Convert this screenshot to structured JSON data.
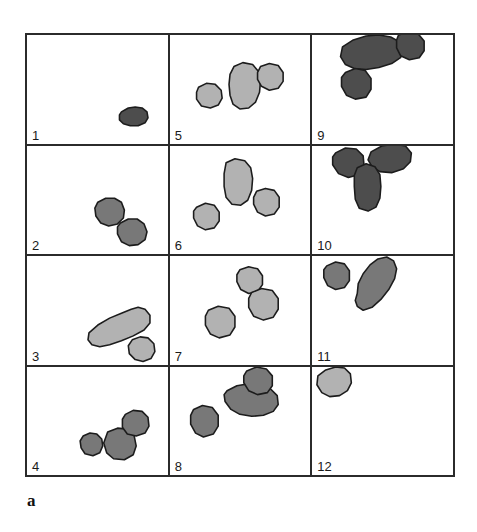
{
  "figure": {
    "caption": "a",
    "grid": {
      "rows": 4,
      "columns": 3,
      "total_panels": 12
    },
    "colors": {
      "light_gray": "#b2b2b2",
      "medium_gray": "#787878",
      "dark_gray": "#4d4d4d",
      "outline": "#1c1c1c",
      "grid_line": "#2b2b2b",
      "background": "#ffffff",
      "label_text": "#1a1a1a"
    },
    "shade_legend": {
      "light_gray": "lightest shaded particles",
      "medium_gray": "mid shaded particles",
      "dark_gray": "darkest shaded particles"
    }
  },
  "panels": [
    {
      "label": "1",
      "position": "row1-col1",
      "blob_count": 1,
      "shade": "dark_gray",
      "description": "single small elongated dark blob at lower right",
      "blobs": [
        {
          "name": "blob-1-1",
          "shade": "dark_gray",
          "points": "96,78 103,74 110,73 117,74 122,78 123,84 120,89 113,92 105,92 98,90 94,86 94,81"
        }
      ]
    },
    {
      "label": "2",
      "position": "row2-col1",
      "blob_count": 2,
      "shade": "medium_gray",
      "description": "two medium gray round blobs lower right, touching diagonally",
      "blobs": [
        {
          "name": "blob-2-1",
          "shade": "medium_gray",
          "points": "72,57 80,53 89,53 96,57 99,65 98,73 92,79 83,81 75,78 70,71 69,63"
        },
        {
          "name": "blob-2-2",
          "shade": "medium_gray",
          "points": "95,78 103,74 112,74 119,79 122,87 120,95 113,100 104,101 96,97 92,89 92,82"
        }
      ]
    },
    {
      "label": "3",
      "position": "row3-col1",
      "blob_count": 2,
      "shade": "light_gray",
      "description": "long diagonal light blob with small round blob at lower right end",
      "blobs": [
        {
          "name": "blob-3-1",
          "shade": "light_gray",
          "points": "63,78 72,70 84,63 96,58 106,54 113,52 120,54 125,60 125,68 119,75 108,81 96,86 84,90 74,92 66,90 62,85"
        },
        {
          "name": "blob-3-2",
          "shade": "light_gray",
          "points": "107,85 115,82 123,83 129,89 130,97 126,104 118,107 110,105 104,99 103,91"
        }
      ]
    },
    {
      "label": "4",
      "position": "row4-col1",
      "blob_count": 3,
      "shade": "medium_gray",
      "description": "three gray blobs, two touching at right, one separate at left",
      "blobs": [
        {
          "name": "blob-4-1",
          "shade": "medium_gray",
          "points": "57,70 64,67 71,68 76,73 77,80 74,87 67,90 59,88 55,82 54,75"
        },
        {
          "name": "blob-4-2",
          "shade": "medium_gray",
          "points": "82,66 92,62 102,63 109,70 111,80 108,89 99,94 88,93 81,87 78,77"
        },
        {
          "name": "blob-4-3",
          "shade": "medium_gray",
          "points": "100,48 108,44 117,45 123,51 124,60 120,67 111,70 102,68 97,61 97,53"
        }
      ]
    },
    {
      "label": "5",
      "position": "row1-col2",
      "blob_count": 3,
      "shade": "light_gray",
      "description": "vertical elongated light blob center with round blob right and round blob left",
      "blobs": [
        {
          "name": "blob-5-1",
          "shade": "light_gray",
          "points": "29,53 37,49 46,50 52,56 53,64 49,71 41,74 32,72 27,65 27,58"
        },
        {
          "name": "blob-5-2",
          "shade": "light_gray",
          "points": "65,32 74,28 84,30 90,37 92,47 91,58 87,68 80,74 71,75 64,70 61,61 60,50 61,40"
        },
        {
          "name": "blob-5-3",
          "shade": "light_gray",
          "points": "92,32 101,29 110,31 115,38 115,47 110,54 101,56 93,52 89,45 89,38"
        }
      ]
    },
    {
      "label": "6",
      "position": "row2-col2",
      "blob_count": 3,
      "shade": "light_gray",
      "description": "tall vertical light blob upper center, round blob to its lower right, round blob lower left",
      "blobs": [
        {
          "name": "blob-6-1",
          "shade": "light_gray",
          "points": "57,17 66,13 76,15 82,22 84,33 83,45 79,55 72,60 63,59 57,52 55,41 55,28"
        },
        {
          "name": "blob-6-2",
          "shade": "light_gray",
          "points": "88,46 97,43 106,45 111,52 111,62 106,69 97,71 89,67 85,59 85,52"
        },
        {
          "name": "blob-6-3",
          "shade": "light_gray",
          "points": "27,62 36,58 45,60 50,67 50,76 45,83 36,85 28,81 24,73 24,66"
        }
      ]
    },
    {
      "label": "7",
      "position": "row3-col2",
      "blob_count": 3,
      "shade": "light_gray",
      "description": "three separate light gray round blobs arranged along a diagonal",
      "blobs": [
        {
          "name": "blob-7-1",
          "shade": "light_gray",
          "points": "71,14 80,11 89,13 94,20 94,29 89,36 80,38 72,34 68,26 68,19"
        },
        {
          "name": "blob-7-2",
          "shade": "light_gray",
          "points": "83,37 93,33 104,35 110,43 110,54 105,62 95,65 85,61 80,52 80,43"
        },
        {
          "name": "blob-7-3",
          "shade": "light_gray",
          "points": "39,55 49,51 60,53 66,61 66,72 61,80 50,83 41,79 36,70 36,61"
        }
      ]
    },
    {
      "label": "8",
      "position": "row4-col2",
      "blob_count": 3,
      "shade": "medium_gray",
      "description": "horizontal elongated blob center, round blob above right touching it, round blob lower left",
      "blobs": [
        {
          "name": "blob-8-1",
          "shade": "medium_gray",
          "points": "58,24 68,19 80,17 92,18 102,22 109,29 110,38 105,45 95,49 83,50 71,48 62,43 56,35 55,28"
        },
        {
          "name": "blob-8-2",
          "shade": "medium_gray",
          "points": "78,4 88,0 98,2 104,9 104,19 99,26 89,28 80,24 75,16 75,9"
        },
        {
          "name": "blob-8-3",
          "shade": "medium_gray",
          "points": "24,43 33,39 43,41 49,49 49,60 44,68 34,71 26,67 21,58 21,49"
        }
      ]
    },
    {
      "label": "9",
      "position": "row1-col3",
      "blob_count": 3,
      "shade": "dark_gray",
      "description": "long horizontal dark blob at top, round dark blob at its right end, round dark blob below left",
      "blobs": [
        {
          "name": "blob-9-1",
          "shade": "dark_gray",
          "points": "31,12 42,5 55,1 68,0 80,2 89,7 93,15 90,23 81,29 68,33 55,35 43,34 34,30 29,22"
        },
        {
          "name": "blob-9-2",
          "shade": "dark_gray",
          "points": "88,0 98,-3 108,-1 114,6 114,16 109,23 99,25 90,21 86,13 86,5"
        },
        {
          "name": "blob-9-3",
          "shade": "dark_gray",
          "points": "34,38 44,34 54,36 60,44 60,55 55,63 44,65 35,61 30,52 30,43"
        }
      ]
    },
    {
      "label": "10",
      "position": "row2-col3",
      "blob_count": 3,
      "shade": "dark_gray",
      "description": "three dark blobs in Y arrangement: round upper left, elongated upper right, vertical elongated center below",
      "blobs": [
        {
          "name": "blob-10-1",
          "shade": "dark_gray",
          "points": "24,7 34,2 45,3 52,10 53,21 48,29 37,32 27,28 21,19 21,11"
        },
        {
          "name": "blob-10-2",
          "shade": "dark_gray",
          "points": "60,6 71,0 84,-2 95,0 101,7 100,16 93,23 81,27 69,26 61,21 57,14"
        },
        {
          "name": "blob-10-3",
          "shade": "dark_gray",
          "points": "46,22 55,18 64,21 69,29 70,41 69,53 65,62 57,66 48,63 44,54 43,41 43,30"
        }
      ]
    },
    {
      "label": "11",
      "position": "row3-col3",
      "blob_count": 2,
      "shade": "medium_gray",
      "description": "small round gray blob upper left and long diagonal gray blob to its right",
      "blobs": [
        {
          "name": "blob-11-1",
          "shade": "medium_gray",
          "points": "15,10 24,6 33,8 38,15 38,25 33,32 24,34 16,30 12,22 12,14"
        },
        {
          "name": "blob-11-2",
          "shade": "medium_gray",
          "points": "46,38 47,28 52,18 59,9 67,3 76,1 83,5 86,13 84,23 78,34 70,44 61,52 52,55 46,51 44,45"
        }
      ]
    },
    {
      "label": "12",
      "position": "row4-col3",
      "blob_count": 1,
      "shade": "light_gray",
      "description": "single light gray blob at top left corner",
      "blobs": [
        {
          "name": "blob-12-1",
          "shade": "light_gray",
          "points": "6,9 14,3 24,0 33,1 39,7 40,16 36,24 28,29 18,30 10,26 5,18"
        }
      ]
    }
  ]
}
